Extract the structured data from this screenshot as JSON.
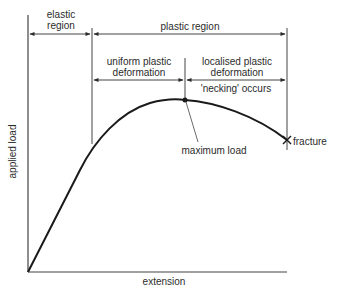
{
  "diagram": {
    "axes": {
      "x_label": "extension",
      "y_label": "applied load"
    },
    "regions": {
      "elastic": [
        "elastic",
        "region"
      ],
      "plastic": "plastic region",
      "uniform": [
        "uniform plastic",
        "deformation"
      ],
      "localised": [
        "localised plastic",
        "deformation"
      ],
      "necking": "'necking' occurs"
    },
    "annotations": {
      "maximum_load": "maximum load",
      "fracture": "fracture"
    },
    "colors": {
      "line": "#2b2b2b",
      "curve": "#1a1a1a",
      "background": "#ffffff"
    }
  }
}
